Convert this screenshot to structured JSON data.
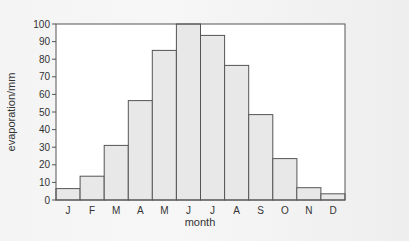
{
  "chart_data": {
    "type": "bar",
    "title": "",
    "xlabel": "month",
    "ylabel": "evaporation/mm",
    "categories": [
      "J",
      "F",
      "M",
      "A",
      "M",
      "J",
      "J",
      "A",
      "S",
      "O",
      "N",
      "D"
    ],
    "values": [
      6.5,
      13.5,
      31,
      56.5,
      85,
      100,
      93.5,
      76.5,
      48.5,
      23.5,
      7,
      3.5
    ],
    "ylim": [
      0,
      100
    ],
    "yticks": [
      0,
      10,
      20,
      30,
      40,
      50,
      60,
      70,
      80,
      90,
      100
    ],
    "grid": false,
    "legend": null,
    "bar_color": "#e8e8e8",
    "bar_edge_color": "#555555",
    "bar_gap": 0
  }
}
